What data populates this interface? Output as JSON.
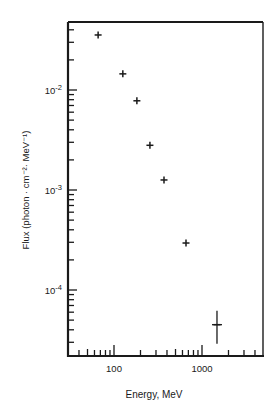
{
  "chart_data": {
    "type": "scatter",
    "title": "",
    "xlabel": "Energy, MeV",
    "ylabel": "Flux (photon · cm⁻²· MeV⁻¹)",
    "xscale": "log",
    "yscale": "log",
    "xlim": [
      30,
      4900
    ],
    "ylim": [
      2.1e-05,
      0.047
    ],
    "grid": false,
    "legend": null,
    "x_tick_labels": [
      {
        "value": 100,
        "label": "100"
      },
      {
        "value": 1000,
        "label": "1000"
      }
    ],
    "y_tick_labels": [
      {
        "value": 0.01,
        "base": "10",
        "exp": "-2"
      },
      {
        "value": 0.001,
        "base": "10",
        "exp": "-3"
      },
      {
        "value": 0.0001,
        "base": "10",
        "exp": "-4"
      }
    ],
    "series": [
      {
        "name": "Flux",
        "marker": "cross",
        "x": [
          66,
          126,
          182,
          256,
          370,
          658,
          1480
        ],
        "y": [
          0.0355,
          0.0145,
          0.0078,
          0.0028,
          0.00126,
          0.000295,
          4.5e-05
        ],
        "y_err_low": [
          null,
          null,
          null,
          null,
          null,
          null,
          2.9e-05
        ],
        "y_err_high": [
          null,
          null,
          null,
          null,
          null,
          null,
          6.2e-05
        ]
      }
    ]
  },
  "layout": {
    "frame": {
      "left": 68,
      "top": 22,
      "right": 263,
      "bottom": 356
    },
    "x_decade_px": 88,
    "x_ref_value": 100,
    "x_ref_px": 114,
    "y_decade_px": 100,
    "y_ref_value": 0.01,
    "y_ref_px": 90
  },
  "colors": {
    "ink": "#1a1a1a",
    "background": "#ffffff"
  }
}
